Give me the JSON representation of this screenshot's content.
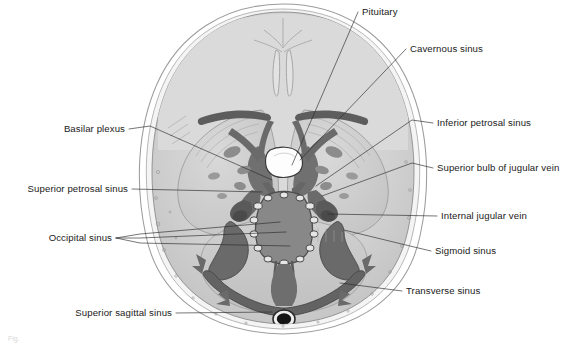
{
  "figure": {
    "caption_partial": "Fig.",
    "background_color": "#ffffff",
    "ink_color": "#1a1a1a",
    "palette": {
      "skull_outer_line": "#9a9a9a",
      "diploe_band": "#f2f2f2",
      "inner_table_line": "#8a8a8a",
      "brain_light": "#d6d6d6",
      "brain_mid": "#c2c2c2",
      "cerebellum": "#cfcfcf",
      "sinus_dark": "#6e6e6e",
      "sinus_darker": "#5a5a5a",
      "bone_black": "#1c1c1c",
      "pituitary_white": "#fdfdfd",
      "leader_line": "#2b2b2b"
    }
  },
  "labels": [
    {
      "id": "pituitary",
      "text": "Pituitary",
      "side": "right",
      "text_x": 362,
      "text_y": 15,
      "leader": "M 358 12 L 292 165"
    },
    {
      "id": "cavernous-sinus",
      "text": "Cavernous sinus",
      "side": "right",
      "text_x": 410,
      "text_y": 52,
      "leader": "M 406 49 L 300 160"
    },
    {
      "id": "inferior-petrosal-sinus",
      "text": "Inferior petrosal sinus",
      "side": "right",
      "text_x": 437,
      "text_y": 126,
      "leader": "M 433 123 L 412 120 L 316 186"
    },
    {
      "id": "superior-bulb-of-jugular-vein",
      "text": "Superior bulb of jugular vein",
      "side": "right",
      "text_x": 437,
      "text_y": 171,
      "leader": "M 433 168 L 412 163 L 322 196"
    },
    {
      "id": "internal-jugular-vein",
      "text": "Internal jugular vein",
      "side": "right",
      "text_x": 441,
      "text_y": 219,
      "leader": "M 437 216 L 328 214"
    },
    {
      "id": "sigmoid-sinus",
      "text": "Sigmoid sinus",
      "side": "right",
      "text_x": 435,
      "text_y": 254,
      "leader": "M 431 251 L 410 246 L 344 230"
    },
    {
      "id": "transverse-sinus",
      "text": "Transverse sinus",
      "side": "right",
      "text_x": 406,
      "text_y": 294,
      "leader": "M 402 291 L 340 283"
    },
    {
      "id": "basilar-plexus",
      "text": "Basilar plexus",
      "side": "left",
      "text_x": 125,
      "text_y": 132,
      "leader": "M 129 129 L 150 126 L 272 180"
    },
    {
      "id": "superior-petrosal-sinus",
      "text": "Superior petrosal sinus",
      "side": "left",
      "text_x": 128,
      "text_y": 192,
      "leader": "M 132 189 L 262 192"
    },
    {
      "id": "occipital-sinus",
      "text": "Occipital sinus",
      "side": "left",
      "text_x": 112,
      "text_y": 241,
      "leader": "M 116 238 L 140 234 L 280 222 M 116 238 L 140 238 L 286 232 M 116 238 L 140 243 L 290 246"
    },
    {
      "id": "superior-sagittal-sinus",
      "text": "Superior sagittal sinus",
      "side": "left",
      "text_x": 172,
      "text_y": 316,
      "leader": "M 176 313 L 272 312"
    }
  ]
}
